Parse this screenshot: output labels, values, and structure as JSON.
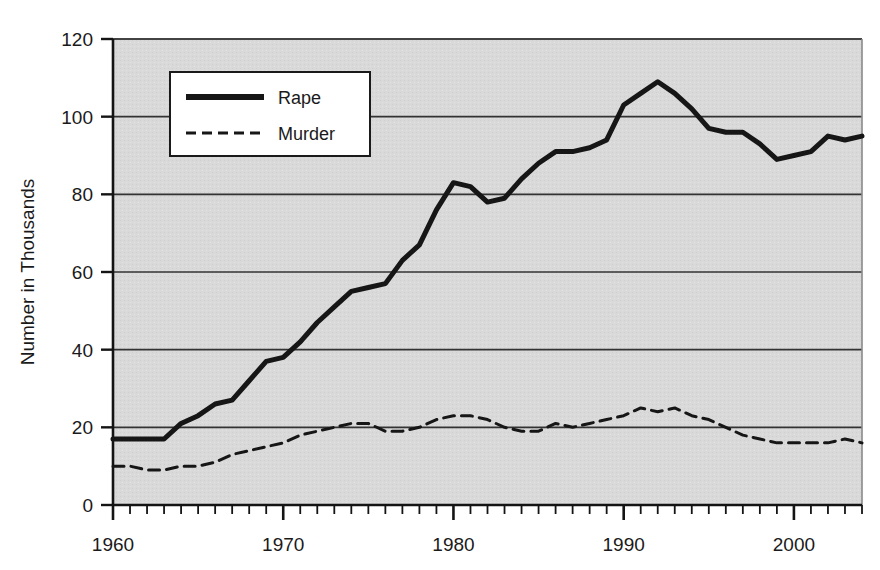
{
  "figure": {
    "clipped_title": "",
    "background_color": "#ffffff",
    "plot_background_color": "#d9d9d9",
    "axis_color": "#1a1a1a",
    "grid_color": "#333333"
  },
  "chart_data": {
    "type": "line",
    "title": "",
    "xlabel": "",
    "ylabel": "Number in Thousands",
    "xlim": [
      1960,
      2004
    ],
    "ylim": [
      0,
      120
    ],
    "yticks": [
      0,
      20,
      40,
      60,
      80,
      100,
      120
    ],
    "ytick_labels": [
      "0",
      "20",
      "40",
      "60",
      "80",
      "100",
      "120"
    ],
    "xticks": [
      1960,
      1970,
      1980,
      1990,
      2000
    ],
    "xtick_labels": [
      "1960",
      "1970",
      "1980",
      "1990",
      "2000"
    ],
    "x_minor_tick_interval": 1,
    "grid": "horizontal",
    "legend_position": "upper left inside",
    "x": [
      1960,
      1961,
      1962,
      1963,
      1964,
      1965,
      1966,
      1967,
      1968,
      1969,
      1970,
      1971,
      1972,
      1973,
      1974,
      1975,
      1976,
      1977,
      1978,
      1979,
      1980,
      1981,
      1982,
      1983,
      1984,
      1985,
      1986,
      1987,
      1988,
      1989,
      1990,
      1991,
      1992,
      1993,
      1994,
      1995,
      1996,
      1997,
      1998,
      1999,
      2000,
      2001,
      2002,
      2003,
      2004
    ],
    "series": [
      {
        "name": "Rape",
        "style": "solid",
        "color": "#161616",
        "width": 5,
        "values": [
          17,
          17,
          17,
          17,
          21,
          23,
          26,
          27,
          32,
          37,
          38,
          42,
          47,
          51,
          55,
          56,
          57,
          63,
          67,
          76,
          83,
          82,
          78,
          79,
          84,
          88,
          91,
          91,
          92,
          94,
          103,
          106,
          109,
          106,
          102,
          97,
          96,
          96,
          93,
          89,
          90,
          91,
          95,
          94,
          95
        ]
      },
      {
        "name": "Murder",
        "style": "dashed",
        "color": "#161616",
        "width": 3,
        "values": [
          10,
          10,
          9,
          9,
          10,
          10,
          11,
          13,
          14,
          15,
          16,
          18,
          19,
          20,
          21,
          21,
          19,
          19,
          20,
          22,
          23,
          23,
          22,
          20,
          19,
          19,
          21,
          20,
          21,
          22,
          23,
          25,
          24,
          25,
          23,
          22,
          20,
          18,
          17,
          16,
          16,
          16,
          16,
          17,
          16
        ]
      }
    ],
    "legend": [
      {
        "label": "Rape",
        "style": "solid"
      },
      {
        "label": "Murder",
        "style": "dashed"
      }
    ]
  }
}
